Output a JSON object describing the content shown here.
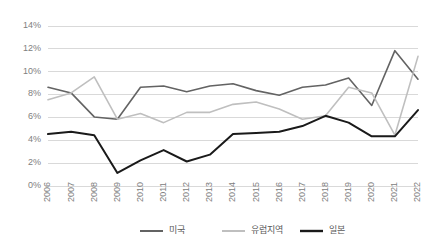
{
  "chart_data": {
    "type": "line",
    "title": "",
    "subtitle": "",
    "xlabel": "",
    "ylabel": "",
    "grid": true,
    "legend_position": "bottom",
    "ylim": [
      0,
      14
    ],
    "ytick_labels": [
      "14%",
      "12%",
      "10%",
      "8%",
      "6%",
      "4%",
      "2%",
      "0%"
    ],
    "ytick_values": [
      14,
      12,
      10,
      8,
      6,
      4,
      2,
      0
    ],
    "categories": [
      "2006",
      "2007",
      "2008",
      "2009",
      "2010",
      "2011",
      "2012",
      "2013",
      "2014",
      "2015",
      "2016",
      "2017",
      "2018",
      "2019",
      "2020",
      "2021",
      "2022"
    ],
    "series": [
      {
        "name": "미국",
        "color": "#636363",
        "width": 1.6,
        "values": [
          8.6,
          8.1,
          6.0,
          5.8,
          8.6,
          8.7,
          8.2,
          8.7,
          8.9,
          8.3,
          7.9,
          8.6,
          8.8,
          9.4,
          7.0,
          11.8,
          9.3
        ]
      },
      {
        "name": "유럽지역",
        "color": "#bfbfbf",
        "width": 1.6,
        "values": [
          7.5,
          8.1,
          9.5,
          5.8,
          6.3,
          5.5,
          6.4,
          6.4,
          7.1,
          7.3,
          6.7,
          5.8,
          6.1,
          8.6,
          8.1,
          4.4,
          11.3
        ]
      },
      {
        "name": "일본",
        "color": "#1a1a1a",
        "width": 2.0,
        "values": [
          4.5,
          4.7,
          4.4,
          1.1,
          2.2,
          3.1,
          2.1,
          2.7,
          4.5,
          4.6,
          4.7,
          5.2,
          6.1,
          5.5,
          4.3,
          4.3,
          6.6
        ]
      }
    ]
  },
  "legend": {
    "items": [
      {
        "label": "미국"
      },
      {
        "label": "유럽지역"
      },
      {
        "label": "일본"
      }
    ]
  },
  "axis": {
    "y_labels": [
      "14%",
      "12%",
      "10%",
      "8%",
      "6%",
      "4%",
      "2%",
      "0%"
    ],
    "x_labels": [
      "2006",
      "2007",
      "2008",
      "2009",
      "2010",
      "2011",
      "2012",
      "2013",
      "2014",
      "2015",
      "2016",
      "2017",
      "2018",
      "2019",
      "2020",
      "2021",
      "2022"
    ]
  }
}
